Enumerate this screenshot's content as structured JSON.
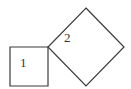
{
  "diagram": {
    "type": "geometric-figure",
    "colors": {
      "stroke": "#3a3a3a",
      "label": "#333333",
      "background": "#ffffff"
    },
    "shapes": [
      {
        "id": "square-1",
        "label": "1",
        "kind": "square",
        "rotation_deg": 0,
        "points": [
          [
            10,
            47
          ],
          [
            48,
            47
          ],
          [
            48,
            86
          ],
          [
            10,
            86
          ]
        ],
        "label_pos": [
          20,
          67
        ]
      },
      {
        "id": "square-2",
        "label": "2",
        "kind": "square",
        "rotation_deg": 45,
        "points": [
          [
            86,
            8
          ],
          [
            124,
            47
          ],
          [
            86,
            86
          ],
          [
            48,
            47
          ]
        ],
        "label_pos": [
          64,
          42
        ]
      }
    ]
  }
}
